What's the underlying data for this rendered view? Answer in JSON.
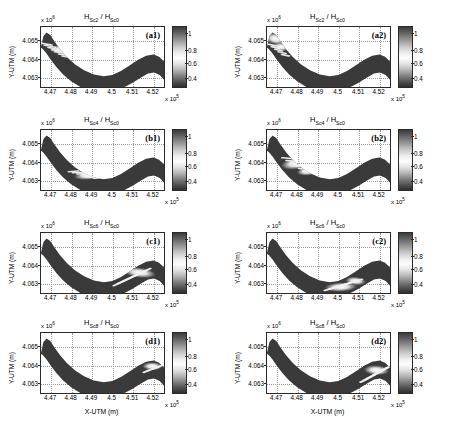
{
  "figure": {
    "axis_labels": {
      "x": "X-UTM (m)",
      "y": "Y-UTM (m)"
    },
    "x_exponent": "x 10",
    "x_exponent_sup": "5",
    "y_exponent": "x 10",
    "y_exponent_sup": "6",
    "xticks": [
      "4.47",
      "4.48",
      "4.49",
      "4.5",
      "4.51",
      "4.52"
    ],
    "yticks": [
      "4.065",
      "4.064",
      "4.063"
    ],
    "colorbar_ticks": [
      "1",
      "0.8",
      "0.6",
      "0.4"
    ]
  },
  "chart_data": {
    "type": "heatmap",
    "xlabel": "X-UTM (m)",
    "ylabel": "Y-UTM (m)",
    "xlim": [
      446500,
      452500
    ],
    "ylim": [
      4062500,
      4065500
    ],
    "x_tick_values": [
      447000,
      448000,
      449000,
      450000,
      451000,
      452000
    ],
    "y_tick_values": [
      4065000,
      4064000,
      4063000
    ],
    "x_scale_exponent": 5,
    "y_scale_exponent": 6,
    "colorbar": {
      "label": "",
      "ticks": [
        1,
        0.8,
        0.6,
        0.4
      ],
      "vmin": 0.3,
      "vmax": 1.1,
      "colormap": "gray-bone"
    },
    "grid": true,
    "legend_position": "none",
    "panels": [
      {
        "id": "a1",
        "label": "(a1)",
        "title_numerator": "H",
        "title_num_sub": "Sc2",
        "title_denominator": "H",
        "title_den_sub": "Sc0",
        "title_text": "H_Sc2 / H_Sc0",
        "row": 0,
        "col": 0,
        "feature_note": "bright comb-like patches on upper-left bank near x=4.47-4.485, y=4.0640-4.0648"
      },
      {
        "id": "a2",
        "label": "(a2)",
        "title_numerator": "H",
        "title_num_sub": "Sc2",
        "title_denominator": "H",
        "title_den_sub": "Sc0",
        "title_text": "H_Sc2 / H_Sc0",
        "row": 0,
        "col": 1,
        "feature_note": "large bright lobe at far upper-left corner near x=4.47, y=4.0645-4.0655"
      },
      {
        "id": "b1",
        "label": "(b1)",
        "title_numerator": "H",
        "title_num_sub": "Sc4",
        "title_denominator": "H",
        "title_den_sub": "Sc0",
        "title_text": "H_Sc4 / H_Sc0",
        "row": 1,
        "col": 0,
        "feature_note": "bright comb patches shifted downstream near x=4.485-4.50, y=4.0632-4.0640"
      },
      {
        "id": "b2",
        "label": "(b2)",
        "title_numerator": "H",
        "title_num_sub": "Sc4",
        "title_denominator": "H",
        "title_den_sub": "Sc0",
        "title_text": "H_Sc4 / H_Sc0",
        "row": 1,
        "col": 1,
        "feature_note": "bright irregular lobes mid-left near x=4.475-4.495, y=4.0635-4.0645"
      },
      {
        "id": "c1",
        "label": "(c1)",
        "title_numerator": "H",
        "title_num_sub": "Sc6",
        "title_denominator": "H",
        "title_den_sub": "Sc0",
        "title_text": "H_Sc6 / H_Sc0",
        "row": 2,
        "col": 0,
        "feature_note": "bright patches along lower-right bend near x=4.505-4.522, y=4.0628-4.0640"
      },
      {
        "id": "c2",
        "label": "(c2)",
        "title_numerator": "H",
        "title_num_sub": "Sc6",
        "title_denominator": "H",
        "title_den_sub": "Sc0",
        "title_text": "H_Sc6 / H_Sc0",
        "row": 2,
        "col": 1,
        "feature_note": "bright band across channel trough near x=4.495-4.512, y=4.0628-4.0638"
      },
      {
        "id": "d1",
        "label": "(d1)",
        "title_numerator": "H",
        "title_num_sub": "Sc8",
        "title_denominator": "H",
        "title_den_sub": "Sc0",
        "title_text": "H_Sc8 / H_Sc0",
        "row": 3,
        "col": 0,
        "feature_note": "single bright lobe at far right rise near x=4.515-4.525, y=4.0636-4.0644"
      },
      {
        "id": "d2",
        "label": "(d2)",
        "title_numerator": "H",
        "title_num_sub": "Sc8",
        "title_denominator": "H",
        "title_den_sub": "Sc0",
        "title_text": "H_Sc8 / H_Sc0",
        "row": 3,
        "col": 1,
        "feature_note": "bright finger-like comb on right limb near x=4.512-4.525, y=4.0630-4.0642"
      }
    ]
  }
}
